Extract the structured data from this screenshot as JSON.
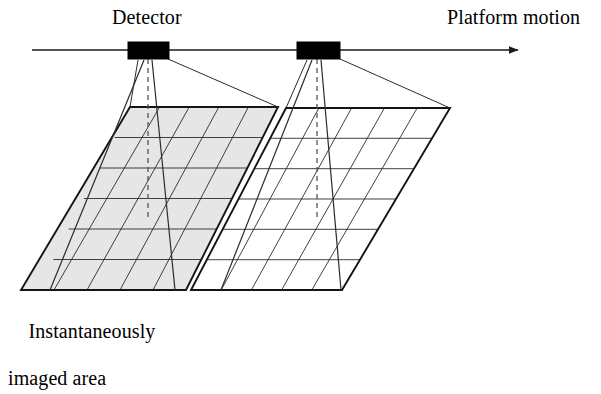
{
  "figure": {
    "type": "pushbroom-scanner-schematic",
    "background_color": "#ffffff",
    "line_color": "#1a1a1a",
    "shade_color": "#e6e6e6",
    "detector_fill": "#000000"
  },
  "labels": {
    "detector": "Detector",
    "platform_motion": "Platform motion",
    "imaged_area_line1": "Instantaneously",
    "imaged_area_line2": "imaged area"
  },
  "platform_track": {
    "y": 50,
    "x_start": 32,
    "x_end": 524,
    "arrow_head": "right"
  },
  "detectors": [
    {
      "name": "detector-1",
      "x": 128,
      "y": 42,
      "width": 41,
      "height": 17
    },
    {
      "name": "detector-2",
      "x": 297,
      "y": 42,
      "width": 43,
      "height": 17
    }
  ],
  "ground_planes": [
    {
      "name": "ground-plane-left",
      "shaded": true,
      "corners": {
        "top_left": [
          130,
          107
        ],
        "top_right": [
          278,
          107
        ],
        "bottom_right": [
          186,
          290
        ],
        "bottom_left": [
          21,
          290
        ]
      },
      "rows": 6,
      "columns": 5
    },
    {
      "name": "ground-plane-right",
      "shaded": false,
      "corners": {
        "top_left": [
          286,
          108
        ],
        "top_right": [
          450,
          108
        ],
        "bottom_right": [
          342,
          290
        ],
        "bottom_left": [
          191,
          290
        ]
      },
      "rows": 6,
      "columns": 5
    }
  ],
  "swaths": [
    {
      "name": "swath-left",
      "description": "instantaneously imaged strip projected from detector 1",
      "apex": [
        147,
        60
      ],
      "ground_left": [
        50,
        290
      ],
      "ground_right": [
        175,
        290
      ]
    },
    {
      "name": "swath-right",
      "description": "instantaneously imaged strip projected from detector 2",
      "apex": [
        316,
        60
      ],
      "ground_left": [
        221,
        290
      ],
      "ground_right": [
        341,
        290
      ]
    }
  ],
  "nadir_lines": [
    {
      "name": "nadir-dashed-left",
      "from": [
        148,
        59
      ],
      "to": [
        148,
        218
      ],
      "style": "dashed"
    },
    {
      "name": "nadir-dashed-right",
      "from": [
        317,
        59
      ],
      "to": [
        317,
        218
      ],
      "style": "dashed"
    }
  ],
  "field_of_view_edges": [
    {
      "name": "fov-left-1",
      "from": [
        140,
        60
      ],
      "to": [
        130,
        107
      ]
    },
    {
      "name": "fov-left-2",
      "from": [
        168,
        59
      ],
      "to": [
        278,
        107
      ]
    },
    {
      "name": "fov-right-1",
      "from": [
        309,
        60
      ],
      "to": [
        286,
        108
      ]
    },
    {
      "name": "fov-right-2",
      "from": [
        340,
        59
      ],
      "to": [
        450,
        108
      ]
    }
  ]
}
